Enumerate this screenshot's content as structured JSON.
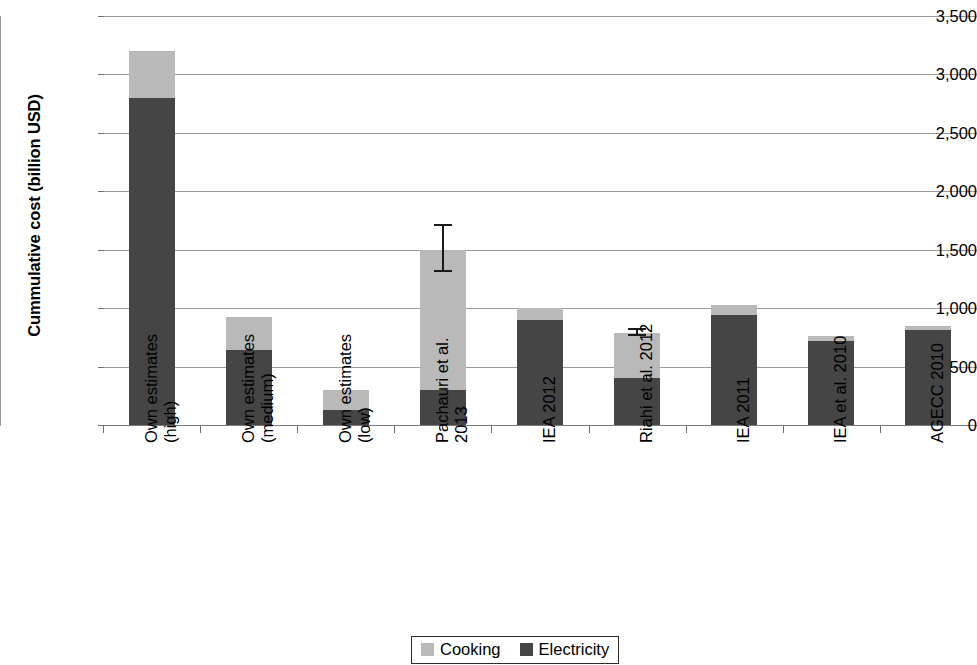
{
  "chart_data": {
    "type": "bar",
    "subtype": "stacked-bar",
    "title": "",
    "xlabel": "",
    "ylabel": "Cummulative cost (billion USD)",
    "ylim": [
      0,
      3500
    ],
    "ytick_interval": 500,
    "ytick_labels": [
      "3,500",
      "3,000",
      "2,500",
      "2,000",
      "1,500",
      "1,000",
      "500",
      "0"
    ],
    "ytick_values": [
      3500,
      3000,
      2500,
      2000,
      1500,
      1000,
      500,
      0
    ],
    "grid": "horizontal",
    "legend_position": "bottom-center",
    "categories": [
      "Own estimates (high)",
      "Own estimates (medium)",
      "Own estimates (low)",
      "Pachauri et al. 2013",
      "IEA 2012",
      "Riahi et al. 2012",
      "IEA 2011",
      "IEA et al. 2010",
      "AGECC 2010"
    ],
    "category_label_lines": [
      [
        "Own estimates",
        "(high)"
      ],
      [
        "Own estimates",
        "(medium)"
      ],
      [
        "Own estimates",
        "(low)"
      ],
      [
        "Pachauri et al.",
        "2013"
      ],
      [
        "IEA 2012",
        ""
      ],
      [
        "Riahi et al. 2012",
        ""
      ],
      [
        "IEA 2011",
        ""
      ],
      [
        "IEA et al. 2010",
        ""
      ],
      [
        "AGECC 2010",
        ""
      ]
    ],
    "series": [
      {
        "name": "Electricity",
        "color": "#454545",
        "values": [
          2800,
          640,
          130,
          300,
          900,
          400,
          940,
          720,
          810
        ]
      },
      {
        "name": "Cooking",
        "color": "#b9b9b9",
        "values": [
          400,
          285,
          170,
          1200,
          100,
          390,
          85,
          45,
          40
        ]
      }
    ],
    "totals": [
      3200,
      925,
      300,
      1500,
      1000,
      790,
      1025,
      765,
      850
    ],
    "error_bars": [
      null,
      null,
      null,
      {
        "value": 1500,
        "low": 1310,
        "high": 1720
      },
      null,
      {
        "value": 790,
        "low": 760,
        "high": 830
      },
      null,
      null,
      null
    ],
    "legend": [
      {
        "label": "Cooking",
        "color": "#b9b9b9"
      },
      {
        "label": "Electricity",
        "color": "#454545"
      }
    ]
  }
}
